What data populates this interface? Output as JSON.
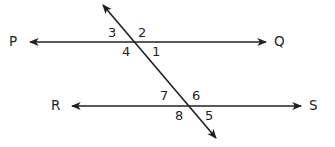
{
  "figure": {
    "background_color": "#ffffff",
    "stroke_color": "#231f20",
    "stroke_width": 1.6,
    "width": 335,
    "height": 147
  },
  "lines": [
    {
      "id": "line-pq",
      "name": "line-PQ",
      "x1": 30,
      "y1": 42,
      "x2": 266,
      "y2": 42,
      "arrow_start": true,
      "arrow_end": true,
      "start_label": "P",
      "end_label": "Q"
    },
    {
      "id": "line-rs",
      "name": "line-RS",
      "x1": 72,
      "y1": 106,
      "x2": 301,
      "y2": 106,
      "arrow_start": true,
      "arrow_end": true,
      "start_label": "R",
      "end_label": "S"
    },
    {
      "id": "transversal",
      "name": "transversal-line",
      "x1": 103,
      "y1": 5,
      "x2": 216,
      "y2": 138,
      "arrow_start": true,
      "arrow_end": true,
      "start_label": "",
      "end_label": ""
    }
  ],
  "endpoint_labels": {
    "p": "P",
    "q": "Q",
    "r": "R",
    "s": "S"
  },
  "angle_labels": {
    "a1": "1",
    "a2": "2",
    "a3": "3",
    "a4": "4",
    "a5": "5",
    "a6": "6",
    "a7": "7",
    "a8": "8"
  },
  "intersections": [
    {
      "name": "upper-intersection",
      "x": 134,
      "y": 42,
      "angles": [
        "3",
        "2",
        "4",
        "1"
      ]
    },
    {
      "name": "lower-intersection",
      "x": 187,
      "y": 106,
      "angles": [
        "7",
        "6",
        "8",
        "5"
      ]
    }
  ]
}
